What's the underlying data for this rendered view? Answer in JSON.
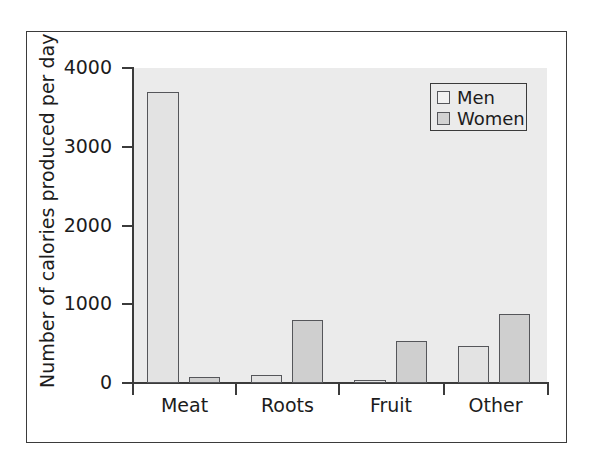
{
  "chart_data": {
    "type": "bar",
    "title": "",
    "subtitle": "",
    "xlabel": "",
    "ylabel": "Number of calories produced per day",
    "categories": [
      "Meat",
      "Roots",
      "Fruit",
      "Other"
    ],
    "series": [
      {
        "name": "Men",
        "values": [
          3700,
          100,
          40,
          470
        ]
      },
      {
        "name": "Women",
        "values": [
          70,
          800,
          530,
          880
        ]
      }
    ],
    "ylim": [
      0,
      4000
    ],
    "yticks": [
      0,
      1000,
      2000,
      3000,
      4000
    ],
    "ytick_labels": [
      "0",
      "1000",
      "2000",
      "3000",
      "4000"
    ],
    "grid": false,
    "legend_position": "top-right",
    "legend_entries": [
      "Men",
      "Women"
    ],
    "colors": {
      "men_fill": "#e3e3e3",
      "women_fill": "#cfcfcf",
      "bar_edge": "#55565a",
      "plot_background": "#ebebeb",
      "axis": "#3b3b3b",
      "text": "#1c1c1c",
      "figure_background": "#ffffff",
      "frame_border": "#3b3b3b"
    }
  }
}
